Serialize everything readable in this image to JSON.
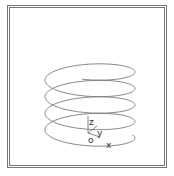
{
  "figure": {
    "type": "3d-helix",
    "turns": 4,
    "line_color": "#777777",
    "frame_color": "#777777"
  },
  "axes": {
    "origin_label": "o",
    "x_label": "x",
    "y_label": "y",
    "z_label": "z"
  }
}
